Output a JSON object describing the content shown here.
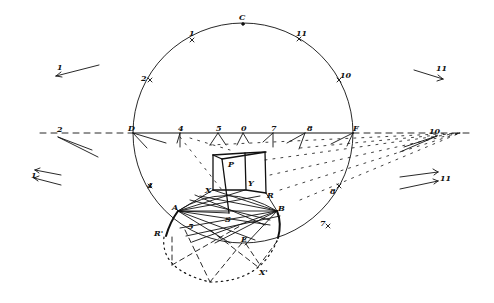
{
  "diagram": {
    "stroke_color": "#111111",
    "background": "#ffffff",
    "circle_labels": {
      "top": "C",
      "upper_left": "1",
      "upper_right": "11",
      "left_mid": "2",
      "right_mid": "10",
      "horizon_left": "D",
      "horizon_right": "F",
      "lower_left": "4",
      "lower_right": "8",
      "bottom_right": "7"
    },
    "horizon_labels": [
      "4",
      "5",
      "0",
      "7",
      "8"
    ],
    "outer_labels": {
      "far_left_top_arrow": "1",
      "far_left_horizon": "2",
      "far_left_bottom_arrows": "1",
      "far_right_top_arrow": "11",
      "far_right_horizon": "10",
      "far_right_bottom_arrows": "11"
    },
    "cube_labels": {
      "P": "P",
      "X": "X",
      "Y": "Y",
      "R": "R",
      "S": "S",
      "A": "A",
      "B": "B"
    },
    "ellipse_labels": {
      "R_prime": "R'",
      "X_prime": "X'",
      "E": "E",
      "five": "5"
    }
  }
}
